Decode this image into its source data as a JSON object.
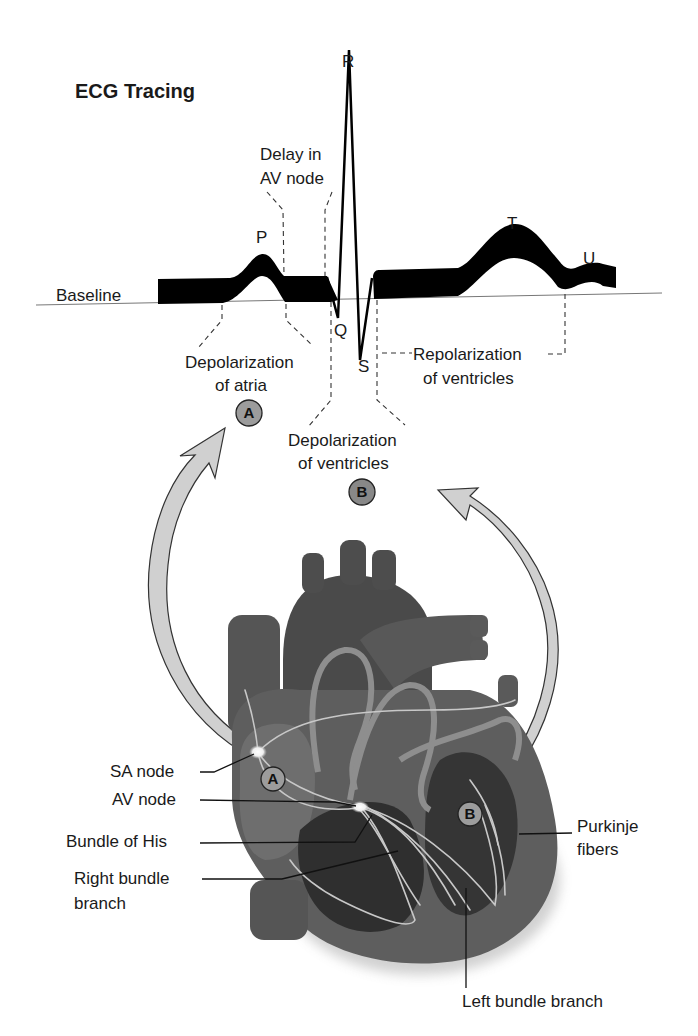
{
  "title": "ECG Tracing",
  "ecg": {
    "baseline_label": "Baseline",
    "waves": {
      "P": "P",
      "Q": "Q",
      "R": "R",
      "S": "S",
      "T": "T",
      "U": "U"
    },
    "annotations": {
      "delay_av_line1": "Delay in",
      "delay_av_line2": "AV node",
      "depol_atria_line1": "Depolarization",
      "depol_atria_line2": "of atria",
      "depol_vent_line1": "Depolarization",
      "depol_vent_line2": "of ventricles",
      "repol_vent_line1": "Repolarization",
      "repol_vent_line2": "of ventricles"
    },
    "badges": {
      "A": "A",
      "B": "B"
    }
  },
  "heart": {
    "badges": {
      "A": "A",
      "B": "B"
    },
    "labels": {
      "sa_node": "SA node",
      "av_node": "AV node",
      "bundle_of_his": "Bundle of His",
      "right_bundle_line1": "Right bundle",
      "right_bundle_line2": "branch",
      "purkinje_line1": "Purkinje",
      "purkinje_line2": "fibers",
      "left_bundle": "Left bundle branch"
    }
  },
  "colors": {
    "background": "#ffffff",
    "ink": "#000000",
    "heart_body": "#5a5a5a",
    "heart_dark": "#3a3a3a",
    "conduction": "#d0d0d0",
    "arrow_fill": "#cfcfcf",
    "badge_fill": "#9a9a9a"
  }
}
